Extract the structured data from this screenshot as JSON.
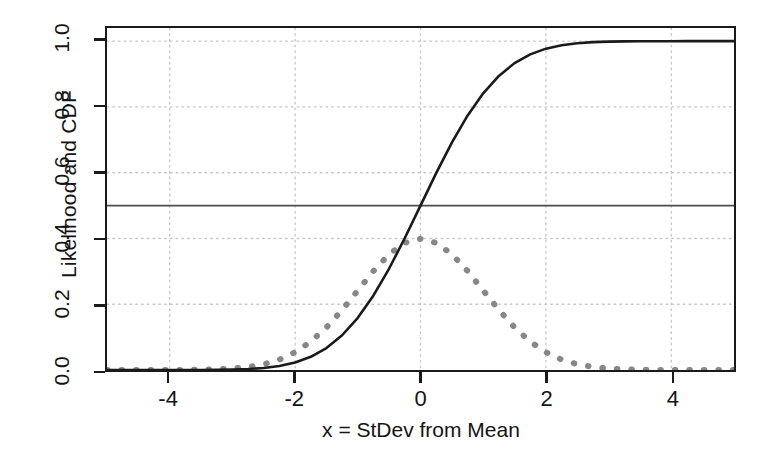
{
  "chart_data": {
    "type": "line",
    "title": "",
    "xlabel": "x = StDev from Mean",
    "ylabel": "Likelihood and CDF",
    "xlim": [
      -5,
      5
    ],
    "ylim": [
      0,
      1.04
    ],
    "xticks": [
      -4,
      -2,
      0,
      2,
      4
    ],
    "xtick_labels": [
      "-4",
      "-2",
      "0",
      "2",
      "4"
    ],
    "yticks": [
      0.0,
      0.2,
      0.4,
      0.6,
      0.8,
      1.0
    ],
    "ytick_labels": [
      "0.0",
      "0.2",
      "0.4",
      "0.6",
      "0.8",
      "1.0"
    ],
    "grid": true,
    "grid_style": "dotted",
    "grid_color": "#c8c8c8",
    "legend": "none",
    "annotations": [
      {
        "name": "half-probability-reference-line",
        "type": "hline",
        "y": 0.5,
        "color": "#4d4d4d",
        "style": "solid"
      }
    ],
    "series": [
      {
        "name": "Likelihood (Normal PDF)",
        "style": "dashed",
        "color": "#878787",
        "width": 6,
        "x": [
          -5.0,
          -4.75,
          -4.5,
          -4.25,
          -4.0,
          -3.75,
          -3.5,
          -3.25,
          -3.0,
          -2.75,
          -2.5,
          -2.25,
          -2.0,
          -1.75,
          -1.5,
          -1.25,
          -1.0,
          -0.75,
          -0.5,
          -0.25,
          0.0,
          0.25,
          0.5,
          0.75,
          1.0,
          1.25,
          1.5,
          1.75,
          2.0,
          2.25,
          2.5,
          2.75,
          3.0,
          3.25,
          3.5,
          3.75,
          4.0,
          4.25,
          4.5,
          4.75,
          5.0
        ],
        "values": [
          1.5e-06,
          5.1e-06,
          1.6e-05,
          4.65e-05,
          0.0001338,
          0.0003461,
          0.0008727,
          0.0020654,
          0.0044318,
          0.0090936,
          0.0175283,
          0.031658,
          0.053991,
          0.0862773,
          0.1295176,
          0.1826491,
          0.2419707,
          0.3011374,
          0.3520653,
          0.3866681,
          0.3989423,
          0.3866681,
          0.3520653,
          0.3011374,
          0.2419707,
          0.1826491,
          0.1295176,
          0.0862773,
          0.053991,
          0.031658,
          0.0175283,
          0.0090936,
          0.0044318,
          0.0020654,
          0.0008727,
          0.0003461,
          0.0001338,
          4.65e-05,
          1.6e-05,
          5.1e-06,
          1.5e-06
        ]
      },
      {
        "name": "CDF (Normal cumulative)",
        "style": "solid",
        "color": "#1a1a1a",
        "width": 2.6,
        "x": [
          -5.0,
          -4.75,
          -4.5,
          -4.25,
          -4.0,
          -3.75,
          -3.5,
          -3.25,
          -3.0,
          -2.75,
          -2.5,
          -2.25,
          -2.0,
          -1.75,
          -1.5,
          -1.25,
          -1.0,
          -0.75,
          -0.5,
          -0.25,
          0.0,
          0.25,
          0.5,
          0.75,
          1.0,
          1.25,
          1.5,
          1.75,
          2.0,
          2.25,
          2.5,
          2.75,
          3.0,
          3.25,
          3.5,
          3.75,
          4.0,
          4.25,
          4.5,
          4.75,
          5.0
        ],
        "values": [
          3e-07,
          1e-06,
          3.4e-06,
          1.07e-05,
          3.17e-05,
          8.84e-05,
          0.0002326,
          0.000577,
          0.0013499,
          0.0029798,
          0.0062097,
          0.0122245,
          0.0227501,
          0.0400592,
          0.0668072,
          0.1056498,
          0.1586553,
          0.2266274,
          0.3085375,
          0.4012937,
          0.5,
          0.5987063,
          0.6914625,
          0.7733726,
          0.8413447,
          0.8943502,
          0.9331928,
          0.9599408,
          0.9772499,
          0.9877755,
          0.9937903,
          0.9970202,
          0.9986501,
          0.999423,
          0.9997674,
          0.9999116,
          0.9999683,
          0.9999893,
          0.9999966,
          0.999999,
          0.9999997
        ]
      }
    ]
  }
}
